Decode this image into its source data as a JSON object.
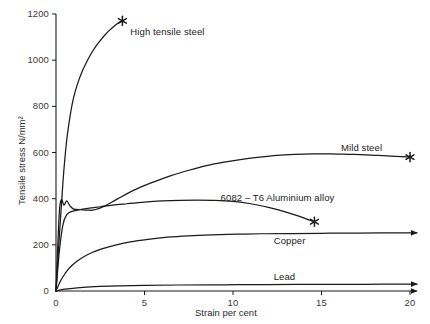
{
  "chart_data": {
    "type": "line",
    "title": "",
    "xlabel": "Strain per cent",
    "ylabel": "Tensile stress N/mm²",
    "xlim": [
      0,
      20
    ],
    "ylim": [
      0,
      1200
    ],
    "xticks": [
      "0",
      "5",
      "10",
      "15",
      "20"
    ],
    "xtick_values": [
      0,
      5,
      10,
      15,
      20
    ],
    "yticks": [
      "0",
      "200",
      "400",
      "600",
      "800",
      "1000",
      "1200"
    ],
    "ytick_values": [
      0,
      200,
      400,
      600,
      800,
      1000,
      1200
    ],
    "grid": false,
    "legend_position": "inline-annotations",
    "axis_arrows": true,
    "fracture_marker": "asterisk",
    "series": [
      {
        "name": "High tensile steel",
        "label": "High tensile steel",
        "label_x": 4.2,
        "label_y": 1120,
        "fracture_point": [
          3.75,
          1170
        ],
        "has_fracture_marker": true,
        "points": [
          [
            0.0,
            0
          ],
          [
            0.2,
            250
          ],
          [
            0.4,
            480
          ],
          [
            0.6,
            650
          ],
          [
            0.8,
            760
          ],
          [
            1.0,
            840
          ],
          [
            1.25,
            905
          ],
          [
            1.5,
            955
          ],
          [
            1.75,
            995
          ],
          [
            2.0,
            1030
          ],
          [
            2.25,
            1060
          ],
          [
            2.5,
            1085
          ],
          [
            2.75,
            1108
          ],
          [
            3.0,
            1128
          ],
          [
            3.25,
            1145
          ],
          [
            3.5,
            1160
          ],
          [
            3.75,
            1170
          ]
        ]
      },
      {
        "name": "Mild steel",
        "label": "Mild steel",
        "label_x": 16.1,
        "label_y": 620,
        "fracture_point": [
          20.0,
          580
        ],
        "has_fracture_marker": true,
        "points": [
          [
            0.0,
            0
          ],
          [
            0.18,
            330
          ],
          [
            0.3,
            395
          ],
          [
            0.45,
            372
          ],
          [
            0.6,
            390
          ],
          [
            0.8,
            368
          ],
          [
            1.0,
            355
          ],
          [
            1.4,
            352
          ],
          [
            1.8,
            350
          ],
          [
            2.2,
            352
          ],
          [
            2.8,
            370
          ],
          [
            3.5,
            400
          ],
          [
            4.5,
            440
          ],
          [
            5.5,
            472
          ],
          [
            6.5,
            500
          ],
          [
            7.5,
            523
          ],
          [
            8.5,
            543
          ],
          [
            9.5,
            558
          ],
          [
            10.5,
            570
          ],
          [
            11.5,
            580
          ],
          [
            12.5,
            588
          ],
          [
            13.5,
            592
          ],
          [
            14.5,
            594
          ],
          [
            15.5,
            594
          ],
          [
            16.5,
            592
          ],
          [
            17.5,
            590
          ],
          [
            18.5,
            586
          ],
          [
            19.2,
            583
          ],
          [
            20.0,
            580
          ]
        ]
      },
      {
        "name": "6082 – T6 Aluminium alloy",
        "label": "6082 – T6 Aluminium alloy",
        "label_x": 9.3,
        "label_y": 405,
        "fracture_point": [
          14.6,
          300
        ],
        "has_fracture_marker": true,
        "points": [
          [
            0.0,
            0
          ],
          [
            0.2,
            180
          ],
          [
            0.4,
            290
          ],
          [
            0.6,
            330
          ],
          [
            0.9,
            345
          ],
          [
            1.3,
            352
          ],
          [
            1.8,
            358
          ],
          [
            2.5,
            365
          ],
          [
            3.2,
            372
          ],
          [
            4.0,
            378
          ],
          [
            5.0,
            385
          ],
          [
            6.0,
            390
          ],
          [
            7.0,
            393
          ],
          [
            8.0,
            394
          ],
          [
            9.0,
            393
          ],
          [
            10.0,
            388
          ],
          [
            11.0,
            378
          ],
          [
            12.0,
            362
          ],
          [
            13.0,
            342
          ],
          [
            13.8,
            322
          ],
          [
            14.3,
            308
          ],
          [
            14.6,
            300
          ]
        ]
      },
      {
        "name": "Copper",
        "label": "Copper",
        "label_x": 12.3,
        "label_y": 215,
        "fracture_point": null,
        "has_fracture_marker": false,
        "arrow_end": true,
        "points": [
          [
            0.0,
            0
          ],
          [
            0.3,
            50
          ],
          [
            0.7,
            95
          ],
          [
            1.2,
            130
          ],
          [
            1.8,
            158
          ],
          [
            2.5,
            180
          ],
          [
            3.3,
            198
          ],
          [
            4.2,
            213
          ],
          [
            5.2,
            224
          ],
          [
            6.3,
            233
          ],
          [
            7.5,
            239
          ],
          [
            8.8,
            243
          ],
          [
            10.2,
            246
          ],
          [
            11.6,
            248
          ],
          [
            13.2,
            249
          ],
          [
            15.0,
            250
          ],
          [
            17.0,
            251
          ],
          [
            20.0,
            252
          ]
        ]
      },
      {
        "name": "Lead",
        "label": "Lead",
        "label_x": 12.3,
        "label_y": 62,
        "fracture_point": null,
        "has_fracture_marker": false,
        "arrow_end": true,
        "points": [
          [
            0.0,
            0
          ],
          [
            0.5,
            8
          ],
          [
            1.2,
            14
          ],
          [
            2.2,
            19
          ],
          [
            3.5,
            22
          ],
          [
            5.0,
            24
          ],
          [
            7.0,
            26
          ],
          [
            9.5,
            27
          ],
          [
            12.0,
            28
          ],
          [
            15.0,
            29
          ],
          [
            17.5,
            29
          ],
          [
            20.0,
            30
          ]
        ]
      }
    ]
  },
  "colors": {
    "axis": "#1a1a1a",
    "curve": "#1a1a1a",
    "tick_text": "#3a3a3a",
    "label_text": "#1a1a1a",
    "background": "#ffffff"
  }
}
